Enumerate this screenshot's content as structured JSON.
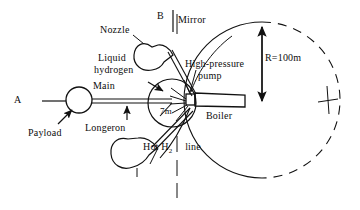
{
  "figure": {
    "type": "engineering-schematic",
    "background_color": "#ffffff",
    "line_color": "#111111"
  },
  "labels": {
    "point_a": "A",
    "point_b": "B",
    "mirror": "Mirror",
    "nozzle": "Nozzle",
    "liquid_hydrogen_line1": "Liquid",
    "liquid_hydrogen_line2": "hydrogen",
    "main": "Main",
    "longeron": "Longeron",
    "payload": "Payload",
    "high_pressure_line1": "High-pressure",
    "high_pressure_line2": "pump",
    "boiler": "Boiler",
    "hot_h2_pre": "Hot H",
    "hot_h2_sub": "2",
    "hot_h2_post": "line",
    "radius_tank": "7m",
    "radius_circle": "R=100m"
  },
  "dimensions": {
    "tank_radius": "7m",
    "rotation_radius": "R=100m"
  },
  "geometry": {
    "circle_center_x": 262,
    "circle_center_y": 100,
    "circle_radius": 78,
    "tank_center_x": 172,
    "tank_center_y": 103,
    "tank_radius_px": 24,
    "payload_center_x": 79,
    "payload_center_y": 100,
    "payload_radius_px": 13,
    "centerline_x": 177
  },
  "colors": {
    "stroke": "#111111",
    "background": "#ffffff",
    "text": "#0d0d0d"
  }
}
